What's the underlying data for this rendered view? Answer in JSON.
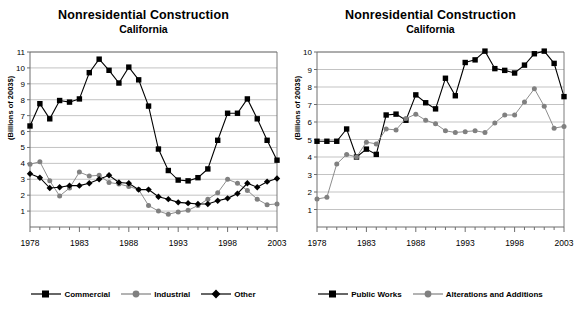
{
  "panels": [
    {
      "title": "Nonresidential Construction",
      "subtitle": "California",
      "ylabel": "(Billions of 2003$)",
      "legend": [
        {
          "label": "Commercial",
          "marker": "square",
          "color": "#000000"
        },
        {
          "label": "Industrial",
          "marker": "circle",
          "color": "#808080"
        },
        {
          "label": "Other",
          "marker": "diamond",
          "color": "#000000"
        }
      ]
    },
    {
      "title": "Nonresidential Construction",
      "subtitle": "California",
      "ylabel": "(Billions of 2003$)",
      "legend": [
        {
          "label": "Public Works",
          "marker": "square",
          "color": "#000000"
        },
        {
          "label": "Alterations and Additions",
          "marker": "circle",
          "color": "#808080"
        }
      ]
    }
  ],
  "chart_data": [
    {
      "type": "line",
      "title": "Nonresidential Construction",
      "subtitle": "California",
      "xlabel": "",
      "ylabel": "(Billions of 2003$)",
      "ylim": [
        0,
        11
      ],
      "yticks": [
        1,
        2,
        3,
        4,
        5,
        6,
        7,
        8,
        9,
        10,
        11
      ],
      "xlim": [
        1978,
        2003
      ],
      "xticks_labeled": [
        1978,
        1983,
        1988,
        1993,
        1998,
        2003
      ],
      "grid": true,
      "legend_position": "bottom",
      "x": [
        1978,
        1979,
        1980,
        1981,
        1982,
        1983,
        1984,
        1985,
        1986,
        1987,
        1988,
        1989,
        1990,
        1991,
        1992,
        1993,
        1994,
        1995,
        1996,
        1997,
        1998,
        1999,
        2000,
        2001,
        2002,
        2003
      ],
      "series": [
        {
          "name": "Commercial",
          "marker": "square",
          "color": "#000000",
          "values": [
            6.35,
            7.75,
            6.8,
            7.95,
            7.85,
            8.05,
            9.7,
            10.55,
            9.85,
            9.05,
            10.05,
            9.25,
            7.6,
            4.9,
            3.55,
            2.95,
            2.9,
            3.1,
            3.65,
            5.45,
            7.15,
            7.15,
            8.05,
            6.8,
            5.45,
            4.2
          ]
        },
        {
          "name": "Industrial",
          "marker": "circle",
          "color": "#808080",
          "values": [
            3.95,
            4.1,
            2.9,
            1.95,
            2.45,
            3.45,
            3.2,
            3.25,
            2.8,
            2.7,
            2.55,
            2.35,
            1.35,
            1.0,
            0.8,
            0.95,
            1.05,
            1.35,
            1.75,
            2.15,
            3.0,
            2.75,
            2.3,
            1.75,
            1.4,
            1.45
          ]
        },
        {
          "name": "Other",
          "marker": "diamond",
          "color": "#000000",
          "values": [
            3.35,
            3.1,
            2.45,
            2.5,
            2.6,
            2.6,
            2.75,
            3.0,
            3.25,
            2.8,
            2.75,
            2.35,
            2.35,
            1.9,
            1.75,
            1.55,
            1.5,
            1.45,
            1.45,
            1.65,
            1.8,
            2.1,
            2.75,
            2.5,
            2.85,
            3.05
          ]
        }
      ]
    },
    {
      "type": "line",
      "title": "Nonresidential Construction",
      "subtitle": "California",
      "xlabel": "",
      "ylabel": "(Billions of 2003$)",
      "ylim": [
        0,
        10
      ],
      "yticks": [
        1,
        2,
        3,
        4,
        5,
        6,
        7,
        8,
        9,
        10
      ],
      "xlim": [
        1978,
        2003
      ],
      "xticks_labeled": [
        1978,
        1983,
        1988,
        1993,
        1998,
        2003
      ],
      "grid": true,
      "legend_position": "bottom",
      "x": [
        1978,
        1979,
        1980,
        1981,
        1982,
        1983,
        1984,
        1985,
        1986,
        1987,
        1988,
        1989,
        1990,
        1991,
        1992,
        1993,
        1994,
        1995,
        1996,
        1997,
        1998,
        1999,
        2000,
        2001,
        2002,
        2003
      ],
      "series": [
        {
          "name": "Public Works",
          "marker": "square",
          "color": "#000000",
          "values": [
            4.9,
            4.9,
            4.9,
            5.6,
            4.0,
            4.45,
            4.15,
            6.4,
            6.45,
            6.1,
            7.55,
            7.1,
            6.75,
            8.5,
            7.5,
            9.4,
            9.55,
            10.05,
            9.05,
            8.95,
            8.8,
            9.25,
            9.9,
            10.05,
            9.35,
            7.45
          ]
        },
        {
          "name": "Alterations and Additions",
          "marker": "circle",
          "color": "#808080",
          "values": [
            1.6,
            1.7,
            3.6,
            4.15,
            4.0,
            4.85,
            4.75,
            5.6,
            5.55,
            6.2,
            6.45,
            6.1,
            5.9,
            5.5,
            5.4,
            5.45,
            5.5,
            5.4,
            5.95,
            6.4,
            6.4,
            7.15,
            7.9,
            6.9,
            5.65,
            5.75
          ]
        }
      ]
    }
  ]
}
